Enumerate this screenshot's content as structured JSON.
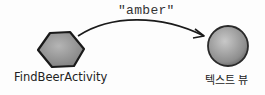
{
  "diagram": {
    "message": "\"amber\"",
    "source": {
      "label": "FindBeerActivity",
      "shape": "hexagon"
    },
    "target": {
      "label": "텍스트 뷰",
      "shape": "circle"
    },
    "edge": {
      "from": "FindBeerActivity",
      "to": "텍스트 뷰",
      "label": "\"amber\""
    },
    "colors": {
      "shape_fill": "#9a9a9a",
      "outline": "#1a1a1a"
    }
  }
}
